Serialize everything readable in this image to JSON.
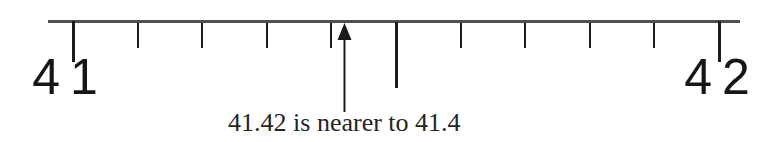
{
  "figure": {
    "caption": "41.42 is nearer to 41.4",
    "start_label": "41",
    "end_label": "42",
    "number_line": {
      "type": "number_line",
      "min": 41,
      "max": 42,
      "tick_step": 0.1,
      "ticks": [
        {
          "value": 41.0,
          "kind": "end"
        },
        {
          "value": 41.1,
          "kind": "minor"
        },
        {
          "value": 41.2,
          "kind": "minor"
        },
        {
          "value": 41.3,
          "kind": "minor"
        },
        {
          "value": 41.4,
          "kind": "minor"
        },
        {
          "value": 41.5,
          "kind": "mid"
        },
        {
          "value": 41.6,
          "kind": "minor"
        },
        {
          "value": 41.7,
          "kind": "minor"
        },
        {
          "value": 41.8,
          "kind": "minor"
        },
        {
          "value": 41.9,
          "kind": "minor"
        },
        {
          "value": 42.0,
          "kind": "end"
        }
      ],
      "arrow_value": 41.42
    },
    "colors": {
      "axis": "#4f4f4f",
      "tick": "#1b1b1b",
      "label": "#161616",
      "caption": "#242424",
      "background": "#ffffff"
    }
  }
}
